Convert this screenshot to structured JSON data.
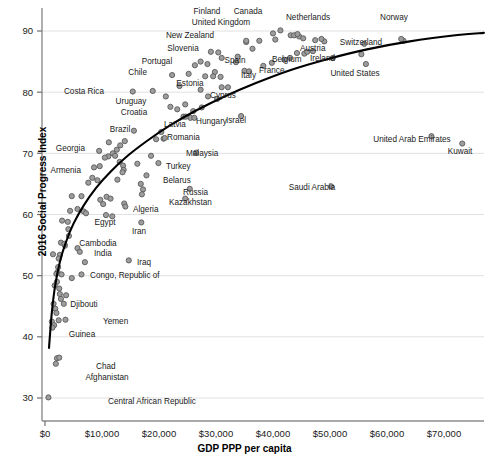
{
  "chart_data": {
    "type": "scatter",
    "title": "",
    "xlabel": "GDP PPP per capita",
    "ylabel": "2016 Social Progress Index",
    "xlim": [
      0,
      78000
    ],
    "ylim": [
      28,
      92
    ],
    "xticks": [
      0,
      10000,
      20000,
      30000,
      40000,
      50000,
      60000,
      70000
    ],
    "xtick_labels": [
      "$0",
      "$10,000",
      "$20,000",
      "$30,000",
      "$40,000",
      "$50,000",
      "$60,000",
      "$70,000"
    ],
    "yticks": [
      30,
      40,
      50,
      60,
      70,
      80,
      90
    ],
    "ytick_labels": [
      "30",
      "40",
      "50",
      "60",
      "70",
      "80",
      "90"
    ],
    "grid": "horizontal",
    "legend": "none",
    "marker_fill": "#9d9d9d",
    "marker_edge": "#5a5a5a",
    "trendline_color": "#000000",
    "labeled_points": [
      {
        "name": "Finland",
        "x": 41300,
        "y": 90.1,
        "lx": 207,
        "ly": 11,
        "anchor": "middle"
      },
      {
        "name": "Canada",
        "x": 44300,
        "y": 89.5,
        "lx": 248,
        "ly": 11,
        "anchor": "middle"
      },
      {
        "name": "Netherlands",
        "x": 48500,
        "y": 88.7,
        "lx": 308,
        "ly": 17,
        "anchor": "middle"
      },
      {
        "name": "Norway",
        "x": 62500,
        "y": 88.7,
        "lx": 394,
        "ly": 17,
        "anchor": "middle"
      },
      {
        "name": "United Kingdom",
        "x": 40400,
        "y": 88.6,
        "lx": 221,
        "ly": 22,
        "anchor": "middle"
      },
      {
        "name": "Switzerland",
        "x": 56000,
        "y": 87.9,
        "lx": 361,
        "ly": 42,
        "anchor": "middle"
      },
      {
        "name": "New Zealand",
        "x": 35300,
        "y": 88.4,
        "lx": 190,
        "ly": 35,
        "anchor": "middle"
      },
      {
        "name": "Slovenia",
        "x": 29100,
        "y": 86.6,
        "lx": 183,
        "ly": 48,
        "anchor": "middle"
      },
      {
        "name": "Austria",
        "x": 46000,
        "y": 86.6,
        "lx": 300,
        "ly": 48,
        "anchor": "start"
      },
      {
        "name": "Belgium",
        "x": 43000,
        "y": 85.6,
        "lx": 272,
        "ly": 59,
        "anchor": "start"
      },
      {
        "name": "Ireland",
        "x": 50500,
        "y": 85.6,
        "lx": 310,
        "ly": 58,
        "anchor": "start"
      },
      {
        "name": "Spain",
        "x": 33800,
        "y": 85.8,
        "lx": 235,
        "ly": 60,
        "anchor": "middle"
      },
      {
        "name": "Portugal",
        "x": 27300,
        "y": 85.0,
        "lx": 157,
        "ly": 61,
        "anchor": "middle"
      },
      {
        "name": "France",
        "x": 39800,
        "y": 84.8,
        "lx": 259,
        "ly": 70,
        "anchor": "start"
      },
      {
        "name": "Italy",
        "x": 35800,
        "y": 83.4,
        "lx": 241,
        "ly": 75,
        "anchor": "start"
      },
      {
        "name": "Chile",
        "x": 22300,
        "y": 82.8,
        "lx": 147,
        "ly": 72,
        "anchor": "end"
      },
      {
        "name": "Estonia",
        "x": 28100,
        "y": 82.6,
        "lx": 190,
        "ly": 83,
        "anchor": "middle"
      },
      {
        "name": "Cyprus",
        "x": 32100,
        "y": 80.8,
        "lx": 223,
        "ly": 95,
        "anchor": "middle"
      },
      {
        "name": "United States",
        "x": 56300,
        "y": 84.6,
        "lx": 355,
        "ly": 73,
        "anchor": "middle"
      },
      {
        "name": "Costa Rica",
        "x": 15400,
        "y": 80.1,
        "lx": 104,
        "ly": 91,
        "anchor": "end"
      },
      {
        "name": "Uruguay",
        "x": 21200,
        "y": 79.3,
        "lx": 131,
        "ly": 101,
        "anchor": "middle"
      },
      {
        "name": "Croatia",
        "x": 22000,
        "y": 77.6,
        "lx": 134,
        "ly": 112,
        "anchor": "middle"
      },
      {
        "name": "Israel",
        "x": 34400,
        "y": 76.1,
        "lx": 226,
        "ly": 120,
        "anchor": "start"
      },
      {
        "name": "Latvia",
        "x": 24700,
        "y": 76.0,
        "lx": 175,
        "ly": 124,
        "anchor": "middle"
      },
      {
        "name": "Hungary",
        "x": 26200,
        "y": 75.8,
        "lx": 196,
        "ly": 121,
        "anchor": "start"
      },
      {
        "name": "Brazil",
        "x": 15600,
        "y": 73.7,
        "lx": 120,
        "ly": 129,
        "anchor": "middle"
      },
      {
        "name": "Romania",
        "x": 21000,
        "y": 72.5,
        "lx": 167,
        "ly": 137,
        "anchor": "start"
      },
      {
        "name": "United Arab Emirates",
        "x": 67800,
        "y": 72.8,
        "lx": 412,
        "ly": 139,
        "anchor": "middle"
      },
      {
        "name": "Kuwait",
        "x": 73200,
        "y": 71.6,
        "lx": 460,
        "ly": 151,
        "anchor": "middle"
      },
      {
        "name": "Georgia",
        "x": 9500,
        "y": 70.4,
        "lx": 85,
        "ly": 148,
        "anchor": "end"
      },
      {
        "name": "Malaysia",
        "x": 26500,
        "y": 70.1,
        "lx": 186,
        "ly": 153,
        "anchor": "start"
      },
      {
        "name": "Turkey",
        "x": 19900,
        "y": 68.4,
        "lx": 166,
        "ly": 166,
        "anchor": "start"
      },
      {
        "name": "Armenia",
        "x": 8600,
        "y": 67.7,
        "lx": 81,
        "ly": 170,
        "anchor": "end"
      },
      {
        "name": "Belarus",
        "x": 17800,
        "y": 66.4,
        "lx": 163,
        "ly": 180,
        "anchor": "start"
      },
      {
        "name": "Russia",
        "x": 25400,
        "y": 64.2,
        "lx": 183,
        "ly": 192,
        "anchor": "start"
      },
      {
        "name": "Kazakhstan",
        "x": 24600,
        "y": 62.6,
        "lx": 169,
        "ly": 202,
        "anchor": "start"
      },
      {
        "name": "Saudi Arabia",
        "x": 50200,
        "y": 64.6,
        "lx": 312,
        "ly": 187,
        "anchor": "middle"
      },
      {
        "name": "Algeria",
        "x": 14100,
        "y": 61.3,
        "lx": 133,
        "ly": 209,
        "anchor": "start"
      },
      {
        "name": "Egypt",
        "x": 10700,
        "y": 59.9,
        "lx": 105,
        "ly": 222,
        "anchor": "middle"
      },
      {
        "name": "Iran",
        "x": 16900,
        "y": 58.7,
        "lx": 139,
        "ly": 231,
        "anchor": "middle"
      },
      {
        "name": "Cambodia",
        "x": 3400,
        "y": 55.2,
        "lx": 98,
        "ly": 243,
        "anchor": "middle"
      },
      {
        "name": "India",
        "x": 6100,
        "y": 53.9,
        "lx": 94,
        "ly": 253,
        "anchor": "start"
      },
      {
        "name": "Iraq",
        "x": 14700,
        "y": 52.5,
        "lx": 137,
        "ly": 262,
        "anchor": "start"
      },
      {
        "name": "Congo, Republic of",
        "x": 6400,
        "y": 50.2,
        "lx": 90,
        "ly": 275,
        "anchor": "start"
      },
      {
        "name": "Djibouti",
        "x": 3300,
        "y": 45.4,
        "lx": 84,
        "ly": 304,
        "anchor": "middle"
      },
      {
        "name": "Yemen",
        "x": 3600,
        "y": 42.8,
        "lx": 103,
        "ly": 321,
        "anchor": "start"
      },
      {
        "name": "Guinea",
        "x": 1300,
        "y": 41.5,
        "lx": 82,
        "ly": 334,
        "anchor": "middle"
      },
      {
        "name": "Chad",
        "x": 2500,
        "y": 36.6,
        "lx": 96,
        "ly": 366,
        "anchor": "start"
      },
      {
        "name": "Afghanistan",
        "x": 1900,
        "y": 35.6,
        "lx": 107,
        "ly": 377,
        "anchor": "middle"
      },
      {
        "name": "Central African Republic",
        "x": 600,
        "y": 30.1,
        "lx": 108,
        "ly": 401,
        "anchor": "start"
      }
    ],
    "unlabeled_points": [
      {
        "x": 40000,
        "y": 89.6
      },
      {
        "x": 43100,
        "y": 89.3
      },
      {
        "x": 43700,
        "y": 89.3
      },
      {
        "x": 44600,
        "y": 89.1
      },
      {
        "x": 45300,
        "y": 88.8
      },
      {
        "x": 47400,
        "y": 88.5
      },
      {
        "x": 49000,
        "y": 88.3
      },
      {
        "x": 62900,
        "y": 88.4
      },
      {
        "x": 37600,
        "y": 88.4
      },
      {
        "x": 35300,
        "y": 88.2
      },
      {
        "x": 36400,
        "y": 87.1
      },
      {
        "x": 30400,
        "y": 86.5
      },
      {
        "x": 47000,
        "y": 86.7
      },
      {
        "x": 44200,
        "y": 86.4
      },
      {
        "x": 45500,
        "y": 86.3
      },
      {
        "x": 55500,
        "y": 86.2
      },
      {
        "x": 31000,
        "y": 85.6
      },
      {
        "x": 28500,
        "y": 84.6
      },
      {
        "x": 42000,
        "y": 85.3
      },
      {
        "x": 33500,
        "y": 84.9
      },
      {
        "x": 26300,
        "y": 84.4
      },
      {
        "x": 38300,
        "y": 84.3
      },
      {
        "x": 29800,
        "y": 83.3
      },
      {
        "x": 25200,
        "y": 83.0
      },
      {
        "x": 35000,
        "y": 83.5
      },
      {
        "x": 29500,
        "y": 82.6
      },
      {
        "x": 30800,
        "y": 82.5
      },
      {
        "x": 23600,
        "y": 81.0
      },
      {
        "x": 27300,
        "y": 80.4
      },
      {
        "x": 31000,
        "y": 80.8
      },
      {
        "x": 18900,
        "y": 80.2
      },
      {
        "x": 28600,
        "y": 79.3
      },
      {
        "x": 30200,
        "y": 78.9
      },
      {
        "x": 24600,
        "y": 78.0
      },
      {
        "x": 27500,
        "y": 77.5
      },
      {
        "x": 23200,
        "y": 77.2
      },
      {
        "x": 26000,
        "y": 76.9
      },
      {
        "x": 24300,
        "y": 76.0
      },
      {
        "x": 25500,
        "y": 75.8
      },
      {
        "x": 14000,
        "y": 72.0
      },
      {
        "x": 11200,
        "y": 71.8
      },
      {
        "x": 20400,
        "y": 73.5
      },
      {
        "x": 19500,
        "y": 72.3
      },
      {
        "x": 20800,
        "y": 72.4
      },
      {
        "x": 13200,
        "y": 71.3
      },
      {
        "x": 12600,
        "y": 70.6
      },
      {
        "x": 11900,
        "y": 70.0
      },
      {
        "x": 12300,
        "y": 69.6
      },
      {
        "x": 11100,
        "y": 69.5
      },
      {
        "x": 10500,
        "y": 69.3
      },
      {
        "x": 13100,
        "y": 68.6
      },
      {
        "x": 18600,
        "y": 69.6
      },
      {
        "x": 16200,
        "y": 68.3
      },
      {
        "x": 13700,
        "y": 68.0
      },
      {
        "x": 13800,
        "y": 67.3
      },
      {
        "x": 13600,
        "y": 66.9
      },
      {
        "x": 9600,
        "y": 67.9
      },
      {
        "x": 8300,
        "y": 66.0
      },
      {
        "x": 9200,
        "y": 65.6
      },
      {
        "x": 7600,
        "y": 65.2
      },
      {
        "x": 12700,
        "y": 65.7
      },
      {
        "x": 16800,
        "y": 65.0
      },
      {
        "x": 17200,
        "y": 64.1
      },
      {
        "x": 17000,
        "y": 63.3
      },
      {
        "x": 6400,
        "y": 63.0
      },
      {
        "x": 4700,
        "y": 63.0
      },
      {
        "x": 10800,
        "y": 62.9
      },
      {
        "x": 11500,
        "y": 62.6
      },
      {
        "x": 9700,
        "y": 62.4
      },
      {
        "x": 13900,
        "y": 61.8
      },
      {
        "x": 10200,
        "y": 61.7
      },
      {
        "x": 5700,
        "y": 60.9
      },
      {
        "x": 4400,
        "y": 60.6
      },
      {
        "x": 6800,
        "y": 60.5
      },
      {
        "x": 7200,
        "y": 60.2
      },
      {
        "x": 11800,
        "y": 59.7
      },
      {
        "x": 3000,
        "y": 59.0
      },
      {
        "x": 4000,
        "y": 58.8
      },
      {
        "x": 4100,
        "y": 57.6
      },
      {
        "x": 4200,
        "y": 56.5
      },
      {
        "x": 2800,
        "y": 55.4
      },
      {
        "x": 3500,
        "y": 54.9
      },
      {
        "x": 5700,
        "y": 54.5
      },
      {
        "x": 1400,
        "y": 53.5
      },
      {
        "x": 2600,
        "y": 53.4
      },
      {
        "x": 2400,
        "y": 52.8
      },
      {
        "x": 7000,
        "y": 52.2
      },
      {
        "x": 2300,
        "y": 51.4
      },
      {
        "x": 2200,
        "y": 50.6
      },
      {
        "x": 2000,
        "y": 50.3
      },
      {
        "x": 2900,
        "y": 50.2
      },
      {
        "x": 4700,
        "y": 49.6
      },
      {
        "x": 2100,
        "y": 49.0
      },
      {
        "x": 1700,
        "y": 48.4
      },
      {
        "x": 2500,
        "y": 47.9
      },
      {
        "x": 2600,
        "y": 47.0
      },
      {
        "x": 3700,
        "y": 46.8
      },
      {
        "x": 2800,
        "y": 46.2
      },
      {
        "x": 1500,
        "y": 45.4
      },
      {
        "x": 1800,
        "y": 44.6
      },
      {
        "x": 2000,
        "y": 43.9
      },
      {
        "x": 1200,
        "y": 42.5
      },
      {
        "x": 2400,
        "y": 42.7
      },
      {
        "x": 1600,
        "y": 41.9
      },
      {
        "x": 2100,
        "y": 36.5
      }
    ],
    "trendline": {
      "description": "logarithmic best fit curve",
      "points": [
        [
          700,
          38.2
        ],
        [
          1200,
          44.0
        ],
        [
          1800,
          48.5
        ],
        [
          2600,
          52.2
        ],
        [
          3600,
          55.3
        ],
        [
          5000,
          58.5
        ],
        [
          6800,
          61.5
        ],
        [
          9000,
          64.4
        ],
        [
          11500,
          67.0
        ],
        [
          14500,
          69.6
        ],
        [
          18000,
          72.1
        ],
        [
          22000,
          74.6
        ],
        [
          26500,
          77.0
        ],
        [
          31500,
          79.3
        ],
        [
          37000,
          81.5
        ],
        [
          43000,
          83.6
        ],
        [
          49500,
          85.4
        ],
        [
          56500,
          87.0
        ],
        [
          64000,
          88.3
        ],
        [
          72000,
          89.3
        ],
        [
          77000,
          89.7
        ]
      ]
    }
  }
}
